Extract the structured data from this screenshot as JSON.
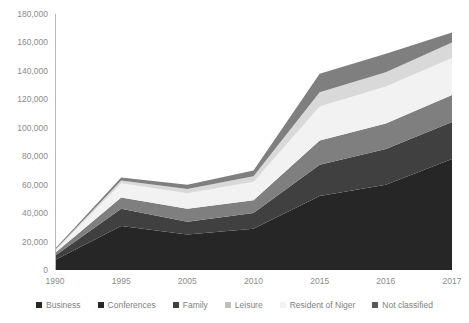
{
  "chart_data": {
    "type": "area",
    "stacked": true,
    "title": "",
    "subtitle": "",
    "xlabel": "",
    "ylabel": "",
    "categories": [
      "1990",
      "1995",
      "2005",
      "2010",
      "2015",
      "2016",
      "2017"
    ],
    "x_tick_labels": [
      "1990",
      "1995",
      "2005",
      "2010",
      "2015",
      "2016",
      "2017"
    ],
    "y_tick_labels": [
      "0",
      "20,000",
      "40,000",
      "60,000",
      "80,000",
      "100,000",
      "120,000",
      "140,000",
      "160,000",
      "180,000"
    ],
    "y_tick_values": [
      0,
      20000,
      40000,
      60000,
      80000,
      100000,
      120000,
      140000,
      160000,
      180000
    ],
    "ylim": [
      0,
      180000
    ],
    "grid": false,
    "legend_position": "bottom",
    "series": [
      {
        "name": "Business",
        "color": "#262626",
        "values": [
          7000,
          31000,
          25000,
          29000,
          52000,
          60000,
          78000
        ]
      },
      {
        "name": "Conferences",
        "color": "#404040",
        "values": [
          3000,
          12000,
          9000,
          11000,
          22000,
          25000,
          26000
        ]
      },
      {
        "name": "Family",
        "color": "#7f7f7f",
        "values": [
          2000,
          8000,
          9000,
          9000,
          17000,
          18000,
          19000
        ]
      },
      {
        "name": "Leisure",
        "color": "#f2f2f2",
        "values": [
          1500,
          10000,
          11000,
          13000,
          24000,
          26000,
          26000
        ]
      },
      {
        "name": "Resident of Niger",
        "color": "#d9d9d9",
        "values": [
          500,
          2000,
          3000,
          4000,
          10000,
          10000,
          11000
        ]
      },
      {
        "name": "Not classified",
        "color": "#7f7f7f",
        "values": [
          1000,
          2000,
          3000,
          4000,
          13000,
          13000,
          7000
        ]
      }
    ]
  },
  "legend": {
    "items": [
      {
        "label": "Business",
        "color": "#262626"
      },
      {
        "label": "Conferences",
        "color": "#262626"
      },
      {
        "label": "Family",
        "color": "#404040"
      },
      {
        "label": "Leisure",
        "color": "#bfbfbf"
      },
      {
        "label": "Resident of Niger",
        "color": "#f2f2f2"
      },
      {
        "label": "Not classified",
        "color": "#595959"
      }
    ]
  },
  "plot_geometry": {
    "left": 55,
    "right": 452,
    "top": 14,
    "bottom": 270
  }
}
